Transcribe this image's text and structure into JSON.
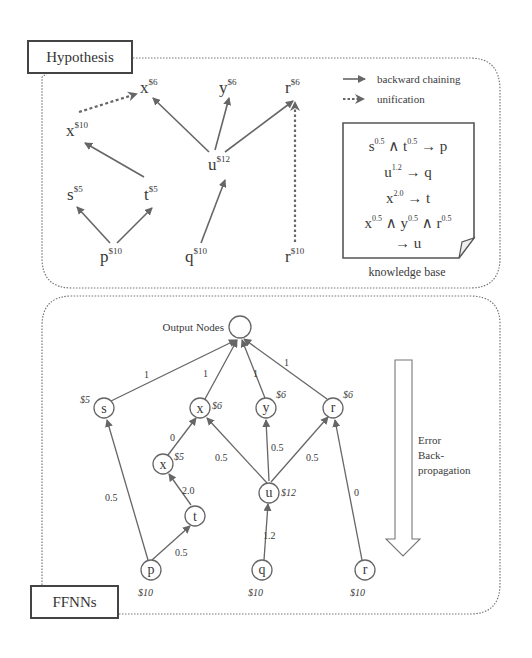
{
  "hypothesis_panel": {
    "title": "Hypothesis",
    "legend": {
      "backward_chaining": "backward chaining",
      "unification": "unification"
    },
    "nodes": [
      {
        "id": "x_top",
        "label": "x",
        "sup": "$6"
      },
      {
        "id": "y_top",
        "label": "y",
        "sup": "$6"
      },
      {
        "id": "r_top",
        "label": "r",
        "sup": "$6"
      },
      {
        "id": "x_mid",
        "label": "x",
        "sup": "$10"
      },
      {
        "id": "u",
        "label": "u",
        "sup": "$12"
      },
      {
        "id": "s",
        "label": "s",
        "sup": "$5"
      },
      {
        "id": "t",
        "label": "t",
        "sup": "$5"
      },
      {
        "id": "p",
        "label": "p",
        "sup": "$10"
      },
      {
        "id": "q",
        "label": "q",
        "sup": "$10"
      },
      {
        "id": "r_bot",
        "label": "r",
        "sup": "$10"
      }
    ],
    "knowledge_base": {
      "caption": "knowledge base",
      "rules": [
        "s^0.5 ∧ t^0.5 → p",
        "u^1.2 → q",
        "x^2.0 → t",
        "x^0.5 ∧ y^0.5 ∧ r^0.5 → u"
      ],
      "rule1": {
        "a": "s",
        "ae": "0.5",
        "op": "∧",
        "b": "t",
        "be": "0.5",
        "arrow": "→",
        "c": "p"
      },
      "rule2": {
        "a": "u",
        "ae": "1.2",
        "arrow": "→",
        "c": "q"
      },
      "rule3": {
        "a": "x",
        "ae": "2.0",
        "arrow": "→",
        "c": "t"
      },
      "rule4": {
        "a": "x",
        "ae": "0.5",
        "op": "∧",
        "b": "y",
        "be": "0.5",
        "op2": "∧",
        "c": "r",
        "ce": "0.5",
        "arrow": "→",
        "d": "u"
      }
    }
  },
  "ffnn_panel": {
    "title": "FFNNs",
    "output_label": "Output Nodes",
    "side_label_lines": [
      "Error",
      "Back-",
      "propagation"
    ],
    "nodes": {
      "s": {
        "label": "s",
        "cost": "$5"
      },
      "x_top": {
        "label": "x",
        "cost": "$6"
      },
      "y": {
        "label": "y",
        "cost": "$6"
      },
      "r_top": {
        "label": "r",
        "cost": "$6"
      },
      "x_low": {
        "label": "x",
        "cost": "$5"
      },
      "u": {
        "label": "u",
        "cost": "$12"
      },
      "t": {
        "label": "t",
        "cost": ""
      },
      "p": {
        "label": "p",
        "cost": "$10"
      },
      "q": {
        "label": "q",
        "cost": "$10"
      },
      "r_bot": {
        "label": "r",
        "cost": "$10"
      }
    },
    "edge_weights": {
      "s_out": "1",
      "x_out": "1",
      "y_out": "1",
      "r_out": "1",
      "xlow_x": "0",
      "u_x": "0.5",
      "u_y": "0.5",
      "u_r": "0.5",
      "t_xlow": "2.0",
      "p_s": "0.5",
      "p_t": "0.5",
      "q_u": "1.2",
      "rbot_r": "0"
    }
  }
}
